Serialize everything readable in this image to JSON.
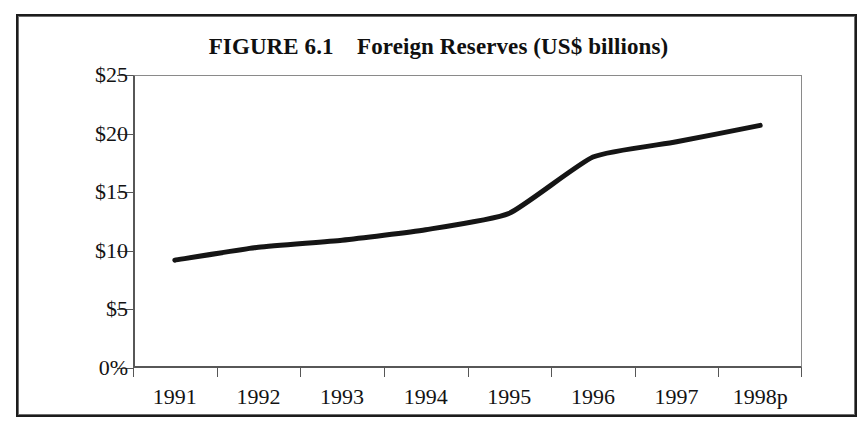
{
  "figure": {
    "title": "FIGURE 6.1    Foreign Reserves (US$ billions)",
    "frame_color": "#1c1c1c",
    "background": "#ffffff"
  },
  "chart_data": {
    "type": "line",
    "title": "FIGURE 6.1    Foreign Reserves (US$ billions)",
    "xlabel": "",
    "ylabel": "",
    "categories": [
      "1991",
      "1992",
      "1993",
      "1994",
      "1995",
      "1996",
      "1997",
      "1998p"
    ],
    "values": [
      9.2,
      10.3,
      10.9,
      11.8,
      13.2,
      18.0,
      19.3,
      20.7
    ],
    "series": [
      {
        "name": "Foreign Reserves",
        "values": [
          9.2,
          10.3,
          10.9,
          11.8,
          13.2,
          18.0,
          19.3,
          20.7
        ],
        "color": "#151515",
        "line_width": 5,
        "markers": false,
        "smoothed": true
      }
    ],
    "ylim": [
      0,
      25
    ],
    "ytick_values": [
      25,
      20,
      15,
      10,
      5,
      0
    ],
    "ytick_labels": [
      "$25",
      "$20",
      "$15",
      "$10",
      "$5",
      "0%"
    ],
    "xtick_labels": [
      "1991",
      "1992",
      "1993",
      "1994",
      "1995",
      "1996",
      "1997",
      "1998p"
    ],
    "grid": false,
    "legend": false,
    "units": "US$ billions"
  }
}
